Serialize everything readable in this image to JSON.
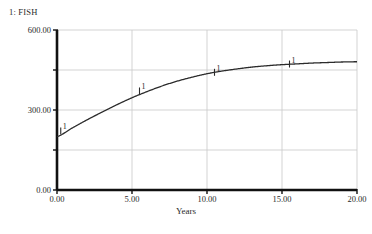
{
  "legend": {
    "entry": "1: FISH",
    "series_index": "1",
    "series_name": "FISH"
  },
  "axis": {
    "x_title": "Years",
    "y_title": "",
    "y_ticks": [
      "0.00",
      "300.00",
      "600.00"
    ],
    "x_ticks": [
      "0.00",
      "5.00",
      "10.00",
      "15.00",
      "20.00"
    ]
  },
  "markers": [
    {
      "label": "1",
      "x": 0.25,
      "y": 212
    },
    {
      "label": "1",
      "x": 5.5,
      "y": 362
    },
    {
      "label": "1",
      "x": 10.5,
      "y": 432
    },
    {
      "label": "1",
      "x": 15.5,
      "y": 463
    }
  ],
  "colors": {
    "axis": "#111111",
    "grid": "#c8c8c8",
    "curve": "#2b2b2b",
    "background": "#ffffff",
    "text": "#2a2a2a"
  },
  "chart_data": {
    "type": "line",
    "title": "",
    "subtitle": "",
    "xlabel": "Years",
    "ylabel": "",
    "xlim": [
      0,
      20
    ],
    "ylim": [
      0,
      600
    ],
    "xticks": [
      0,
      5,
      10,
      15,
      20
    ],
    "yticks": [
      0,
      300,
      600
    ],
    "minor_yticks": [
      150,
      450
    ],
    "grid": true,
    "legend_position": "top-left",
    "series": [
      {
        "name": "FISH",
        "index": 1,
        "marker_label": "1",
        "x": [
          0,
          1,
          2,
          3,
          4,
          5,
          6,
          7,
          8,
          9,
          10,
          11,
          12,
          13,
          14,
          15,
          16,
          17,
          18,
          19,
          20
        ],
        "values": [
          200,
          232,
          263,
          292,
          320,
          346,
          369,
          390,
          408,
          423,
          436,
          446,
          454,
          461,
          466,
          470,
          473,
          476,
          478,
          480,
          481
        ]
      }
    ]
  }
}
